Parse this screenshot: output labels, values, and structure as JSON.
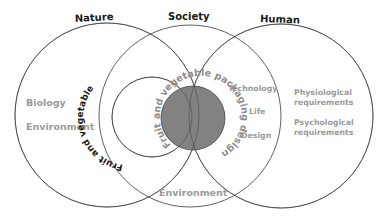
{
  "diagram": {
    "type": "venn",
    "circles": [
      {
        "id": "nature",
        "title": "Nature",
        "items": [
          "Biology",
          "Environment"
        ]
      },
      {
        "id": "society",
        "title": "Society",
        "items": [
          "Environment"
        ]
      },
      {
        "id": "human",
        "title": "Human",
        "items": [
          "Physiological requirements",
          "Psychological requirements"
        ]
      }
    ],
    "titles": {
      "nature": "Nature",
      "society": "Society",
      "human": "Human"
    },
    "nature_items": {
      "biology": "Biology",
      "environment": "Environment"
    },
    "society_items": {
      "environment": "Environment",
      "technology": "Technology",
      "life": "Life",
      "design": "Design"
    },
    "human_items": {
      "physiological_line1": "Physiological",
      "physiological_line2": "requirements",
      "psychological_line1": "Psychological",
      "psychological_line2": "requirements"
    },
    "inner_circle_label": "Fruit and vegetable",
    "core_label": "Fruit and vegetable packaging design",
    "colors": {
      "stroke": "#3a3a3a",
      "core_fill": "#828282",
      "label_gray": "#9a9a9a",
      "title_dark": "#1a1a1a"
    }
  }
}
